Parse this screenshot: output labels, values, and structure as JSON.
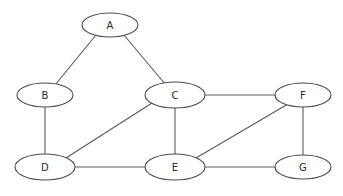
{
  "diagram": {
    "canvas": {
      "width": 343,
      "height": 196,
      "background": "#ffffff"
    },
    "style": {
      "node_fill": "#ffffff",
      "node_stroke": "#4d4d4d",
      "edge_stroke": "#5a5a5a",
      "label_color": "#2b2b2b",
      "node_rx": 28,
      "node_ry": 12,
      "stroke_width": 1.1
    },
    "nodes": [
      {
        "id": "A",
        "label": "A",
        "cx": 110,
        "cy": 25,
        "rx": 28,
        "ry": 12
      },
      {
        "id": "B",
        "label": "B",
        "cx": 45,
        "cy": 95,
        "rx": 28,
        "ry": 12
      },
      {
        "id": "C",
        "label": "C",
        "cx": 175,
        "cy": 95,
        "rx": 30,
        "ry": 13
      },
      {
        "id": "F",
        "label": "F",
        "cx": 303,
        "cy": 95,
        "rx": 28,
        "ry": 12
      },
      {
        "id": "D",
        "label": "D",
        "cx": 45,
        "cy": 167,
        "rx": 30,
        "ry": 13
      },
      {
        "id": "E",
        "label": "E",
        "cx": 175,
        "cy": 167,
        "rx": 30,
        "ry": 13
      },
      {
        "id": "G",
        "label": "G",
        "cx": 303,
        "cy": 167,
        "rx": 28,
        "ry": 12
      }
    ],
    "edges": [
      {
        "id": "A-B",
        "from": "A",
        "to": "B",
        "x1": 96,
        "y1": 35,
        "x2": 55,
        "y2": 85
      },
      {
        "id": "A-C",
        "from": "A",
        "to": "C",
        "x1": 124,
        "y1": 35,
        "x2": 165,
        "y2": 84
      },
      {
        "id": "B-D",
        "from": "B",
        "to": "D",
        "x1": 45,
        "y1": 107,
        "x2": 45,
        "y2": 154
      },
      {
        "id": "C-D",
        "from": "C",
        "to": "D",
        "x1": 152,
        "y1": 103,
        "x2": 66,
        "y2": 158
      },
      {
        "id": "C-E",
        "from": "C",
        "to": "E",
        "x1": 175,
        "y1": 108,
        "x2": 175,
        "y2": 154
      },
      {
        "id": "C-F",
        "from": "C",
        "to": "F",
        "x1": 205,
        "y1": 95,
        "x2": 275,
        "y2": 95
      },
      {
        "id": "D-E",
        "from": "D",
        "to": "E",
        "x1": 75,
        "y1": 167,
        "x2": 145,
        "y2": 167
      },
      {
        "id": "E-F",
        "from": "E",
        "to": "F",
        "x1": 196,
        "y1": 158,
        "x2": 288,
        "y2": 104
      },
      {
        "id": "E-G",
        "from": "E",
        "to": "G",
        "x1": 205,
        "y1": 167,
        "x2": 275,
        "y2": 167
      },
      {
        "id": "F-G",
        "from": "F",
        "to": "G",
        "x1": 303,
        "y1": 107,
        "x2": 303,
        "y2": 155
      }
    ]
  }
}
